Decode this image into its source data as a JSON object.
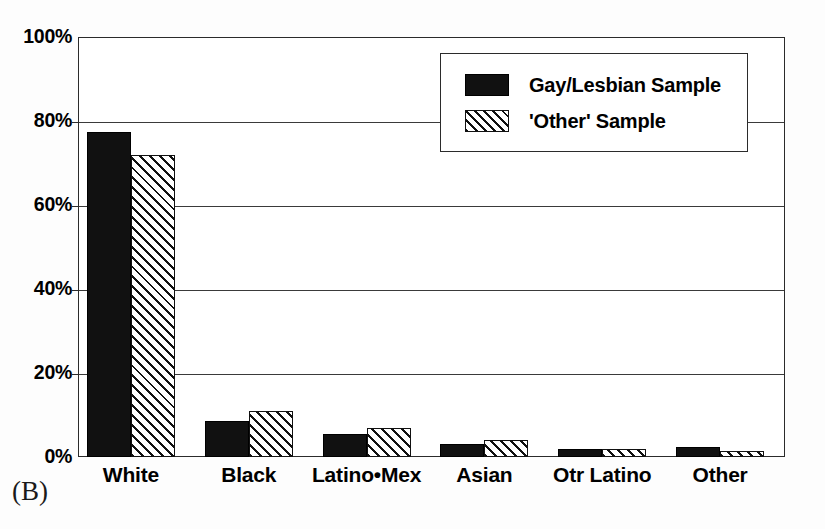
{
  "figure": {
    "panel_letter": "(B)"
  },
  "chart_data": {
    "type": "bar",
    "title": "",
    "subtitle": "",
    "xlabel": "",
    "ylabel": "",
    "categories": [
      "White",
      "Black",
      "Latino•Mex",
      "Asian",
      "Otr Latino",
      "Other"
    ],
    "series": [
      {
        "name": "Gay/Lesbian Sample",
        "pattern": "solid-black",
        "color": "#111111",
        "values": [
          77.5,
          8.5,
          5.5,
          3,
          2,
          2.5
        ]
      },
      {
        "name": "'Other' Sample",
        "pattern": "diagonal-hatch",
        "color": "#ffffff",
        "values": [
          72,
          11,
          7,
          4,
          2,
          1.5
        ]
      }
    ],
    "ylim": [
      0,
      100
    ],
    "yticks": [
      0,
      20,
      40,
      60,
      80,
      100
    ],
    "ytick_labels": [
      "0%",
      "20%",
      "40%",
      "60%",
      "80%",
      "100%"
    ],
    "grid": true,
    "grid_axis": "y",
    "legend_position": "upper-right-inside",
    "value_unit": "percent"
  },
  "legend": {
    "entries": [
      {
        "label": "Gay/Lesbian Sample"
      },
      {
        "label": "'Other' Sample"
      }
    ]
  }
}
